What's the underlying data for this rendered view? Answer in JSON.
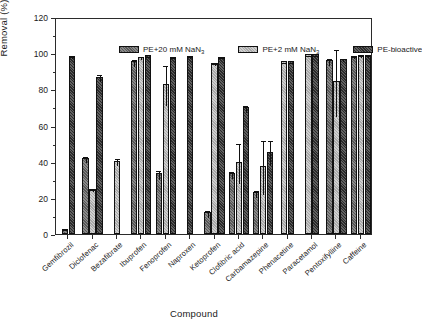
{
  "chart_data": {
    "type": "bar",
    "title": "",
    "xlabel": "Compound",
    "ylabel": "Removal (%)",
    "ylim": [
      0,
      120
    ],
    "yticks": [
      0,
      20,
      40,
      60,
      80,
      100,
      120
    ],
    "grid": false,
    "legend_position": "top-inside",
    "categories": [
      "Gemfibrozil",
      "Diclofenac",
      "Bezafibrate",
      "Ibuprofen",
      "Fenoprofen",
      "Naproxen",
      "Ketoprofen",
      "Clofibric acid",
      "Carbamazepine",
      "Phenacetine",
      "Paracetamol",
      "Pentoxifylline",
      "Caffeine"
    ],
    "series": [
      {
        "name": "PE+20 mM NaN3",
        "name_html": "PE+20 mM NaN<sub>3</sub>",
        "color": "#585858",
        "values": [
          3.0,
          42.0,
          null,
          95.5,
          33.5,
          null,
          12.0,
          33.5,
          23.0,
          null,
          null,
          96.0,
          98.5
        ],
        "errors": [
          0.5,
          1.8,
          null,
          2.0,
          2.5,
          null,
          1.8,
          2.0,
          2.0,
          null,
          null,
          2.0,
          0.5
        ]
      },
      {
        "name": "PE+2 mM NaN3",
        "name_html": "PE+2 mM NaN<sub>3</sub>",
        "color": "#a8a8a8",
        "values": [
          null,
          25.0,
          40.5,
          98.0,
          83.0,
          null,
          94.5,
          40.0,
          37.5,
          95.5,
          99.5,
          84.5,
          99.0
        ],
        "errors": [
          null,
          0.6,
          2.0,
          0.8,
          11.0,
          null,
          0.5,
          11.0,
          15.0,
          0.4,
          0.3,
          18.5,
          0.4
        ]
      },
      {
        "name": "PE-bioactive",
        "name_html": "PE-bioactive",
        "color": "#2a2a2a",
        "values": [
          98.5,
          87.0,
          null,
          98.8,
          98.0,
          98.5,
          98.0,
          70.0,
          45.5,
          95.5,
          99.5,
          97.0,
          99.0
        ],
        "errors": [
          0.4,
          2.0,
          null,
          0.4,
          0.4,
          0.6,
          0.4,
          2.0,
          7.0,
          0.4,
          0.3,
          0.8,
          0.4
        ]
      }
    ]
  },
  "axes": {
    "y_title": "Removal (%)",
    "x_title": "Compound",
    "y_tick_labels": [
      "0",
      "20",
      "40",
      "60",
      "80",
      "100",
      "120"
    ]
  }
}
